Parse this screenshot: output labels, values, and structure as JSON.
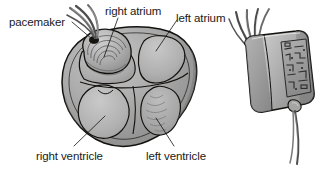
{
  "figure": {
    "background_color": "#ffffff",
    "ink_color": "#1a1a1a",
    "style": "grayscale line-and-tone medical illustration"
  },
  "labels": {
    "pacemaker": "pacemaker",
    "right_atrium": "right atrium",
    "left_atrium": "left atrium",
    "right_ventricle": "right ventricle",
    "left_ventricle": "left ventricle"
  },
  "heart": {
    "name": "heart-cutaway",
    "chambers": [
      {
        "id": "right-atrium",
        "label": "right atrium",
        "position": "upper-left"
      },
      {
        "id": "left-atrium",
        "label": "left atrium",
        "position": "upper-right"
      },
      {
        "id": "right-ventricle",
        "label": "right ventricle",
        "position": "lower-left"
      },
      {
        "id": "left-ventricle",
        "label": "left ventricle",
        "position": "lower-right"
      }
    ],
    "implant_site": "pacemaker lead attachment on right atrial appendage",
    "fill_color": "#9a9a9a",
    "chamber_fill_color": "#b4b4b4",
    "outline_color": "#14120f"
  },
  "device": {
    "name": "pacemaker-device",
    "shape": "rounded rectangular generator, tilted",
    "lead_count": 4,
    "body_color": "#b8b8b8",
    "panel_color": "#a0a0a0",
    "outline_color": "#14120f",
    "connector": "cable exits lower-right connector port"
  }
}
